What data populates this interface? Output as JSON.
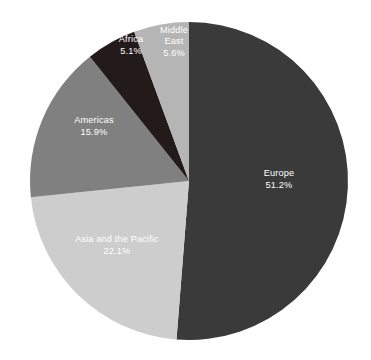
{
  "background_color": "#ffffff",
  "chart_data": {
    "type": "pie",
    "title": "",
    "subtitle": "",
    "xlabel": "",
    "ylabel": "",
    "legend_position": "none",
    "grid": false,
    "labels_inside_slices": true,
    "value_suffix": "%",
    "start_angle_deg": 0,
    "direction": "clockwise",
    "center": {
      "x": 189,
      "y": 181
    },
    "radius": 159,
    "categories": [
      "Europe",
      "Asia and the Pacific",
      "Americas",
      "Africa",
      "Middle East"
    ],
    "values": [
      51.2,
      22.1,
      15.9,
      5.1,
      5.6
    ],
    "colors": [
      "#3a3a3a",
      "#cdcdcd",
      "#808080",
      "#231a1a",
      "#b5b5b5"
    ],
    "slices": [
      {
        "name": "Europe",
        "value": 51.2,
        "value_text": "51.2%",
        "color": "#3a3a3a",
        "label_color": "#ffffff",
        "label_lines": [
          "Europe",
          "51.2%"
        ],
        "label_pos": {
          "x": 279,
          "y": 180
        }
      },
      {
        "name": "Asia and the Pacific",
        "value": 22.1,
        "value_text": "22.1%",
        "color": "#cdcdcd",
        "label_color": "#ffffff",
        "label_lines": [
          "Asia and the Pacific",
          "22.1%"
        ],
        "label_pos": {
          "x": 117,
          "y": 246
        }
      },
      {
        "name": "Americas",
        "value": 15.9,
        "value_text": "15.9%",
        "color": "#808080",
        "label_color": "#ffffff",
        "label_lines": [
          "Americas",
          "15.9%"
        ],
        "label_pos": {
          "x": 94,
          "y": 127
        }
      },
      {
        "name": "Africa",
        "value": 5.1,
        "value_text": "5.1%",
        "color": "#231a1a",
        "label_color": "#ffffff",
        "label_lines": [
          "Africa",
          "5.1%"
        ],
        "label_pos": {
          "x": 131,
          "y": 46
        }
      },
      {
        "name": "Middle East",
        "value": 5.6,
        "value_text": "5.6%",
        "color": "#b5b5b5",
        "label_color": "#ffffff",
        "label_lines": [
          "Middle",
          "East",
          "5.6%"
        ],
        "label_pos": {
          "x": 174,
          "y": 42
        }
      }
    ]
  }
}
